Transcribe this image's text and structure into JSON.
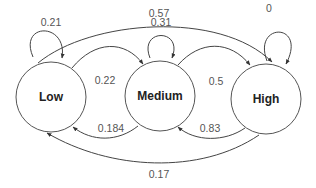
{
  "diagram": {
    "type": "markov-state-transition",
    "nodes": [
      {
        "id": "low",
        "label": "Low",
        "cx": 51,
        "cy": 97,
        "r": 35
      },
      {
        "id": "medium",
        "label": "Medium",
        "cx": 160,
        "cy": 96,
        "r": 35
      },
      {
        "id": "high",
        "label": "High",
        "cx": 266,
        "cy": 99,
        "r": 35
      }
    ],
    "edges": [
      {
        "id": "low-low",
        "from": "Low",
        "to": "Low",
        "label": "0.21",
        "path": "M 33 57 C 18 22, 68 22, 62 58",
        "label_x": 51,
        "label_y": 22
      },
      {
        "id": "medium-medium",
        "from": "Medium",
        "to": "Medium",
        "label": "0.31",
        "path": "M 150 58 C 138 28, 184 28, 172 58",
        "label_x": 161,
        "label_y": 22
      },
      {
        "id": "high-high",
        "from": "High",
        "to": "High",
        "label": "0",
        "path": "M 267 61 C 252 22, 308 22, 286 64",
        "label_x": 269,
        "label_y": 8
      },
      {
        "id": "low-high",
        "from": "Low",
        "to": "High",
        "label": "0.57",
        "path": "M 38 63 C 90 20, 220 10, 272 62",
        "label_x": 159,
        "label_y": 13
      },
      {
        "id": "low-medium",
        "from": "Low",
        "to": "Medium",
        "label": "0.22",
        "path": "M 72 68 C 95 40, 125 40, 143 64",
        "label_x": 105,
        "label_y": 80
      },
      {
        "id": "medium-high",
        "from": "Medium",
        "to": "High",
        "label": "0.5",
        "path": "M 178 65 C 200 40, 230 40, 250 65",
        "label_x": 216,
        "label_y": 81
      },
      {
        "id": "medium-low",
        "from": "Medium",
        "to": "Low",
        "label": "0.184",
        "path": "M 138 126 C 118 142, 92 142, 73 127",
        "label_x": 111,
        "label_y": 128
      },
      {
        "id": "high-medium",
        "from": "High",
        "to": "Medium",
        "label": "0.83",
        "path": "M 245 128 C 225 142, 195 142, 178 127",
        "label_x": 210,
        "label_y": 128
      },
      {
        "id": "high-low",
        "from": "High",
        "to": "Low",
        "label": "0.17",
        "path": "M 259 135 C 200 175, 110 170, 47 133",
        "label_x": 159,
        "label_y": 174
      }
    ],
    "colors": {
      "stroke": "#444444",
      "node_stroke": "#555555",
      "label_text": "#555555",
      "node_text": "#222222",
      "background": "#ffffff"
    }
  }
}
